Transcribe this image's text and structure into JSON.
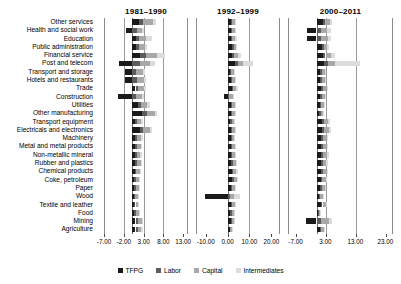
{
  "chart_data": {
    "type": "bar",
    "subtype": "stacked-horizontal-bar-small-multiples",
    "title": "",
    "xlabel": "",
    "ylabel": "",
    "grid": true,
    "legend_position": "bottom-center",
    "orientation": "horizontal",
    "stacked": true,
    "categories": [
      "Other services",
      "Health and social work",
      "Education",
      "Public administration",
      "Financial service",
      "Post and telecom",
      "Transport and storage",
      "Hotels and restaurants",
      "Trade",
      "Construction",
      "Utilities",
      "Other manufacturing",
      "Transport equipment",
      "Electricals and electronics",
      "Machinery",
      "Metal and metal products",
      "Non-metallic mineral",
      "Rubber and plastics",
      "Chemical products",
      "Coke, petroleum",
      "Paper",
      "Wood",
      "Textile and leather",
      "Food",
      "Mining",
      "Agriculture"
    ],
    "legend": [
      {
        "name": "TFPG",
        "color": "#1a1a1a"
      },
      {
        "name": "Labor",
        "color": "#5c5c5c"
      },
      {
        "name": "Capital",
        "color": "#a8a8a8"
      },
      {
        "name": "Intermediates",
        "color": "#dcdcdc"
      }
    ],
    "panels": [
      {
        "title": "1981–1990",
        "xlim": [
          -7.0,
          14.2
        ],
        "xticks": [
          -7.0,
          -2.0,
          3.0,
          8.0,
          13.0
        ],
        "xticklabels": [
          "-7.00",
          "-2.00",
          "3.00",
          "8.00",
          "13.00"
        ],
        "series": [
          {
            "name": "TFPG",
            "values": [
              1.9,
              -1.4,
              1.05,
              1.05,
              2.2,
              -3.1,
              -1.6,
              -1.7,
              0.95,
              -3.4,
              1.55,
              2.55,
              0.85,
              2.0,
              0.8,
              0.75,
              0.75,
              0.8,
              0.7,
              0.65,
              0.6,
              0.5,
              0.55,
              0.6,
              0.95,
              0.95
            ]
          },
          {
            "name": "Labor",
            "values": [
              0.9,
              1.25,
              0.85,
              0.75,
              1.35,
              2.05,
              1.2,
              1.3,
              0.75,
              1.05,
              0.85,
              1.2,
              0.55,
              0.95,
              0.6,
              0.55,
              0.55,
              0.55,
              0.5,
              0.45,
              0.45,
              0.4,
              0.4,
              0.45,
              0.55,
              0.55
            ]
          },
          {
            "name": "Capital",
            "values": [
              2.45,
              1.35,
              1.65,
              1.55,
              2.75,
              2.65,
              1.55,
              1.7,
              1.35,
              1.45,
              1.55,
              2.05,
              0.95,
              1.55,
              1.05,
              0.95,
              0.9,
              0.95,
              0.85,
              0.8,
              0.75,
              0.65,
              0.7,
              0.75,
              1.0,
              0.95
            ]
          },
          {
            "name": "Intermediates",
            "values": [
              0.75,
              0.5,
              1.45,
              0.55,
              2.1,
              1.3,
              0.7,
              0.6,
              0.55,
              0.55,
              0.6,
              0.7,
              0.4,
              0.55,
              0.4,
              0.4,
              0.35,
              0.4,
              0.35,
              0.3,
              0.3,
              0.25,
              0.3,
              0.3,
              0.4,
              0.4
            ]
          }
        ]
      },
      {
        "title": "1992–1999",
        "xlim": [
          -14.5,
          24.0
        ],
        "xticks": [
          -10.0,
          0.0,
          10.0,
          20.0
        ],
        "xticklabels": [
          "-10.00",
          "0.00",
          "10.00",
          "20.00"
        ],
        "series": [
          {
            "name": "TFPG",
            "values": [
              1.45,
              1.4,
              1.55,
              2.1,
              2.2,
              3.55,
              1.2,
              1.35,
              1.85,
              -1.7,
              1.4,
              1.4,
              1.3,
              1.45,
              1.45,
              1.45,
              1.55,
              1.7,
              1.85,
              2.0,
              1.6,
              -10.4,
              1.55,
              1.3,
              1.45,
              0.9
            ]
          },
          {
            "name": "Labor",
            "values": [
              0.6,
              0.7,
              0.65,
              0.6,
              0.85,
              1.05,
              0.55,
              0.65,
              0.7,
              0.85,
              0.6,
              0.6,
              0.55,
              0.6,
              0.55,
              0.6,
              0.6,
              0.65,
              0.7,
              0.75,
              0.6,
              0.95,
              0.6,
              0.5,
              0.55,
              0.4
            ]
          },
          {
            "name": "Capital",
            "values": [
              1.15,
              1.2,
              1.4,
              1.3,
              1.85,
              2.55,
              1.1,
              1.2,
              1.45,
              1.5,
              1.2,
              1.15,
              1.1,
              1.2,
              1.1,
              1.15,
              1.2,
              1.3,
              1.4,
              1.5,
              1.2,
              1.75,
              1.25,
              1.0,
              1.1,
              0.8
            ]
          },
          {
            "name": "Intermediates",
            "values": [
              0.45,
              0.5,
              0.7,
              0.5,
              1.2,
              4.7,
              0.45,
              0.5,
              0.6,
              0.6,
              0.5,
              0.45,
              0.45,
              0.5,
              0.45,
              0.5,
              0.5,
              0.55,
              0.6,
              0.65,
              0.5,
              2.9,
              0.55,
              0.4,
              0.45,
              0.35
            ]
          }
        ]
      },
      {
        "title": "2000–2011",
        "xlim": [
          -9.5,
          25.5
        ],
        "xticks": [
          -7.0,
          3.0,
          13.0,
          23.0
        ],
        "xticklabels": [
          "-7.00",
          "3.00",
          "13.00",
          "23.00"
        ],
        "series": [
          {
            "name": "TFPG",
            "values": [
              2.05,
              -3.1,
              -3.2,
              1.95,
              2.1,
              2.65,
              1.2,
              1.2,
              1.45,
              1.2,
              1.05,
              0.95,
              1.7,
              1.85,
              1.55,
              1.5,
              1.6,
              1.45,
              1.5,
              1.35,
              1.25,
              0.85,
              1.4,
              0.45,
              -3.6,
              1.15
            ]
          },
          {
            "name": "Labor",
            "values": [
              0.8,
              1.35,
              1.4,
              0.6,
              0.9,
              1.2,
              0.55,
              0.55,
              0.65,
              0.55,
              0.5,
              0.45,
              0.7,
              0.75,
              0.65,
              0.65,
              0.7,
              0.6,
              0.65,
              0.6,
              0.55,
              0.4,
              0.6,
              0.25,
              1.55,
              0.5
            ]
          },
          {
            "name": "Capital",
            "values": [
              1.55,
              2.3,
              2.45,
              1.1,
              1.7,
              2.35,
              1.05,
              1.05,
              1.25,
              1.05,
              0.95,
              0.85,
              1.35,
              1.45,
              1.25,
              1.25,
              1.3,
              1.15,
              1.25,
              1.1,
              1.05,
              0.75,
              1.15,
              0.45,
              2.6,
              0.95
            ]
          },
          {
            "name": "Intermediates",
            "values": [
              0.7,
              1.05,
              1.1,
              0.45,
              1.35,
              8.35,
              0.45,
              0.45,
              0.55,
              0.45,
              0.4,
              0.35,
              0.6,
              0.65,
              0.55,
              0.55,
              0.6,
              0.5,
              0.55,
              0.5,
              0.45,
              0.3,
              0.5,
              0.2,
              1.15,
              0.4
            ]
          }
        ]
      }
    ]
  }
}
